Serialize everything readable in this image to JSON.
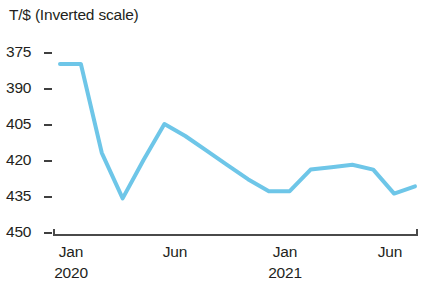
{
  "chart_data": {
    "type": "line",
    "title": "T/$ (Inverted scale)",
    "xlabel": "",
    "ylabel": "T/$",
    "inverted_y_axis": true,
    "grid": false,
    "legend": null,
    "y_ticks": [
      375,
      390,
      405,
      420,
      435,
      450
    ],
    "ylim": [
      375,
      450
    ],
    "x_tick_labels": [
      {
        "month": "Jan",
        "year": "2020"
      },
      {
        "month": "Jun",
        "year": ""
      },
      {
        "month": "Jan",
        "year": "2021"
      },
      {
        "month": "Jun",
        "year": ""
      }
    ],
    "series_color": "#6ec6e8",
    "x": [
      "Jan 2020",
      "Feb 2020",
      "Mar 2020",
      "Apr 2020",
      "May 2020",
      "Jun 2020",
      "Jul 2020",
      "Aug 2020",
      "Sep 2020",
      "Oct 2020",
      "Nov 2020",
      "Dec 2020",
      "Jan 2021",
      "Feb 2021",
      "Mar 2021",
      "Apr 2021",
      "May 2021",
      "Jun 2021"
    ],
    "series": [
      {
        "name": "T/$",
        "values": [
          380,
          380,
          417,
          436,
          420,
          405,
          410,
          416,
          422,
          428,
          433,
          433,
          424,
          423,
          422,
          424,
          434,
          431
        ]
      }
    ]
  },
  "axis": {
    "y_tick_labels": [
      "375",
      "390",
      "405",
      "420",
      "435",
      "450"
    ],
    "x_months": [
      "Jan",
      "Jun",
      "Jan",
      "Jun"
    ],
    "x_years": [
      "2020",
      "2021"
    ]
  }
}
